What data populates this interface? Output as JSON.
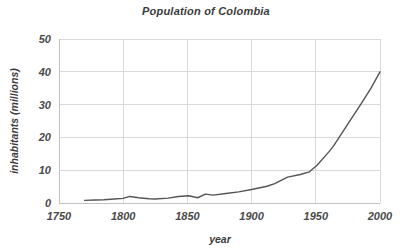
{
  "chart_data": {
    "type": "line",
    "title": "Population of Colombia",
    "xlabel": "year",
    "ylabel": "inhabitants (millions)",
    "xlim": [
      1750,
      2000
    ],
    "ylim": [
      0,
      50
    ],
    "xticks": [
      1750,
      1800,
      1850,
      1900,
      1950,
      2000
    ],
    "yticks": [
      0,
      10,
      20,
      30,
      40,
      50
    ],
    "xtick_labels": [
      "1750",
      "1800",
      "1850",
      "1900",
      "1950",
      "2000"
    ],
    "ytick_labels": [
      "0",
      "10",
      "20",
      "30",
      "40",
      "50"
    ],
    "grid": true,
    "legend": false,
    "legend_position": "none",
    "line_color": "#555555",
    "series": [
      {
        "name": "Population of Colombia",
        "x": [
          1770,
          1778,
          1785,
          1793,
          1800,
          1805,
          1812,
          1820,
          1825,
          1835,
          1843,
          1851,
          1858,
          1864,
          1870,
          1880,
          1890,
          1900,
          1912,
          1918,
          1928,
          1938,
          1945,
          1951,
          1960,
          1964,
          1973,
          1985,
          1993,
          2000
        ],
        "y": [
          0.8,
          0.9,
          1.0,
          1.2,
          1.4,
          2.0,
          1.6,
          1.3,
          1.2,
          1.5,
          2.0,
          2.2,
          1.6,
          2.7,
          2.4,
          2.9,
          3.4,
          4.1,
          5.1,
          5.9,
          7.9,
          8.7,
          9.5,
          11.5,
          15.5,
          17.5,
          22.9,
          30.1,
          35.0,
          40.0
        ]
      }
    ]
  },
  "axis": {
    "title_text": "Population of Colombia",
    "x_title": "year",
    "y_title": "inhabitants (millions)"
  }
}
